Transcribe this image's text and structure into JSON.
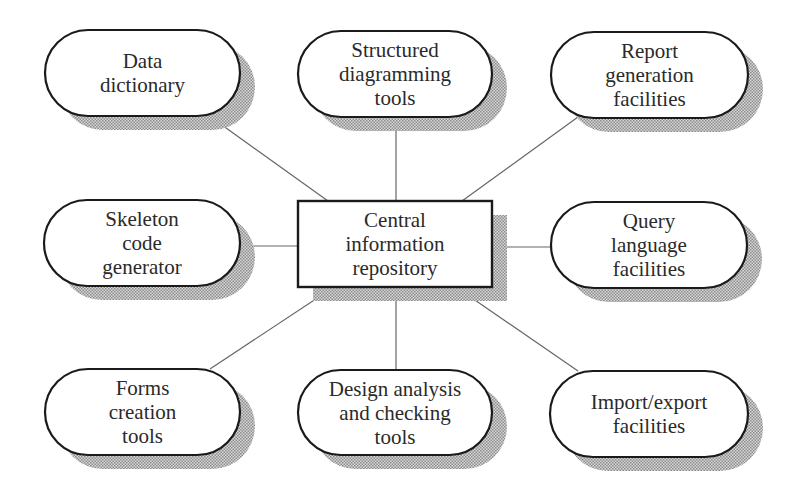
{
  "diagram": {
    "type": "hub-and-spoke",
    "center": {
      "id": "central",
      "lines": [
        "Central",
        "information",
        "repository"
      ],
      "shape": "rectangle",
      "box": {
        "x": 298,
        "y": 201,
        "w": 194,
        "h": 86
      }
    },
    "nodes": [
      {
        "id": "data-dictionary",
        "lines": [
          "Data",
          "dictionary"
        ],
        "box": {
          "x": 45,
          "y": 30,
          "w": 195,
          "h": 86
        },
        "link": {
          "x1": 208,
          "y1": 115,
          "x2": 328,
          "y2": 201
        }
      },
      {
        "id": "structured-diagramming-tools",
        "lines": [
          "Structured",
          "diagramming",
          "tools"
        ],
        "box": {
          "x": 298,
          "y": 31,
          "w": 194,
          "h": 86
        },
        "link": {
          "x1": 396,
          "y1": 117,
          "x2": 396,
          "y2": 201
        }
      },
      {
        "id": "report-generation-facilities",
        "lines": [
          "Report",
          "generation",
          "facilities"
        ],
        "box": {
          "x": 551,
          "y": 32,
          "w": 197,
          "h": 86
        },
        "link": {
          "x1": 578,
          "y1": 117,
          "x2": 462,
          "y2": 201
        }
      },
      {
        "id": "skeleton-code-generator",
        "lines": [
          "Skeleton",
          "code",
          "generator"
        ],
        "box": {
          "x": 44,
          "y": 200,
          "w": 196,
          "h": 86
        },
        "link": {
          "x1": 240,
          "y1": 246,
          "x2": 298,
          "y2": 246
        }
      },
      {
        "id": "query-language-facilities",
        "lines": [
          "Query",
          "language",
          "facilities"
        ],
        "box": {
          "x": 551,
          "y": 202,
          "w": 196,
          "h": 86
        },
        "link": {
          "x1": 492,
          "y1": 247,
          "x2": 551,
          "y2": 247
        }
      },
      {
        "id": "forms-creation-tools",
        "lines": [
          "Forms",
          "creation",
          "tools"
        ],
        "box": {
          "x": 45,
          "y": 369,
          "w": 195,
          "h": 86
        },
        "link": {
          "x1": 210,
          "y1": 369,
          "x2": 334,
          "y2": 287
        }
      },
      {
        "id": "design-analysis-checking-tools",
        "lines": [
          "Design analysis",
          "and checking",
          "tools"
        ],
        "box": {
          "x": 298,
          "y": 370,
          "w": 194,
          "h": 85
        },
        "link": {
          "x1": 396,
          "y1": 287,
          "x2": 396,
          "y2": 370
        }
      },
      {
        "id": "import-export-facilities",
        "lines": [
          "Import/export",
          "facilities"
        ],
        "box": {
          "x": 550,
          "y": 371,
          "w": 198,
          "h": 86
        },
        "link": {
          "x1": 578,
          "y1": 371,
          "x2": 456,
          "y2": 287
        }
      }
    ],
    "style": {
      "stroke": "#1a1a1a",
      "link_stroke": "#666666",
      "shadow_fill": "#9a9a9a",
      "shadow_offset": {
        "dx": 15,
        "dy": 14
      },
      "text_color": "#2a2a2a"
    }
  }
}
